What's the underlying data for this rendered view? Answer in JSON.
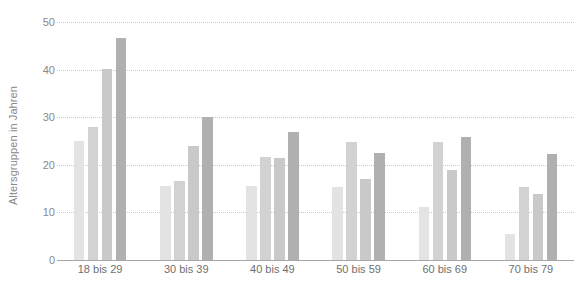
{
  "chart_data": {
    "type": "bar",
    "title": "",
    "subtitle": "",
    "xlabel": "",
    "ylabel": "Altersgruppen in Jahren",
    "categories": [
      "18 bis 29",
      "30 bis 39",
      "40 bis 49",
      "50 bis 59",
      "60 bis 69",
      "70 bis 79"
    ],
    "ylim": [
      0,
      50
    ],
    "yticks": [
      0,
      10,
      20,
      30,
      40,
      50
    ],
    "ytick_labels": [
      "0",
      "10",
      "20",
      "30",
      "40",
      "50"
    ],
    "grid": true,
    "legend": "none",
    "series": [
      {
        "name": "series-1",
        "color": "#e3e3e3",
        "values": [
          25.0,
          15.6,
          15.5,
          15.3,
          11.1,
          5.4
        ]
      },
      {
        "name": "series-2",
        "color": "#d2d2d2",
        "values": [
          28.0,
          16.6,
          21.6,
          24.8,
          24.8,
          15.3
        ]
      },
      {
        "name": "series-3",
        "color": "#c9c9c9",
        "values": [
          40.1,
          24.0,
          21.5,
          17.0,
          18.9,
          13.8
        ]
      },
      {
        "name": "series-4",
        "color": "#b0b0b0",
        "values": [
          46.6,
          30.0,
          26.9,
          22.4,
          25.8,
          22.3
        ]
      }
    ]
  },
  "style": {
    "background": "#ffffff",
    "gridline_color": "#c9c9c9",
    "axis_color": "#a6a6a6",
    "tick_text_color": "#8a8a8a",
    "category_text_color": "#6f6f6f",
    "axis_title_color": "#888888"
  }
}
